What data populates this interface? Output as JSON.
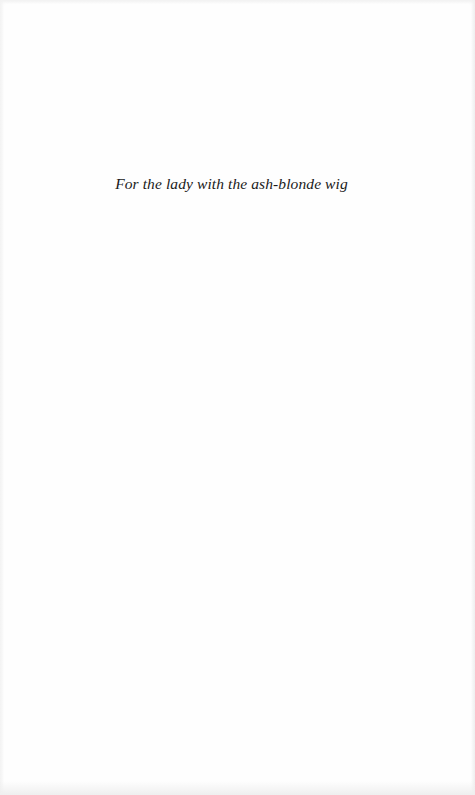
{
  "page": {
    "type": "dedication",
    "dedication_text": "For the lady with the ash-blonde wig"
  },
  "colors": {
    "background": "#fefefe",
    "text": "#1a1a1a"
  }
}
